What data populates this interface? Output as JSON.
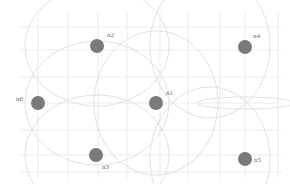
{
  "diagram": {
    "type": "wireless-network-topology",
    "width": 290,
    "height": 184,
    "colors": {
      "background": "#ffffff",
      "grid": "#e6e6e6",
      "range_circle": "#dcdcdc",
      "node": "#7a7a7a",
      "label": "#6a6a6a"
    },
    "grid": {
      "x_lines": [
        38,
        68,
        98,
        127,
        160,
        188,
        220,
        245,
        278
      ],
      "y_lines": [
        27,
        50,
        77,
        103,
        130,
        155,
        172
      ],
      "x_extent": [
        20,
        282
      ],
      "y_extent": [
        12,
        178
      ]
    },
    "nodes": [
      {
        "id": "n0",
        "label": "n0",
        "x": 38,
        "y": 103,
        "r": 7,
        "label_dx": -22,
        "label_dy": -2
      },
      {
        "id": "n1",
        "label": "n1",
        "x": 156,
        "y": 103,
        "r": 7,
        "label_dx": 10,
        "label_dy": -8
      },
      {
        "id": "n2",
        "label": "n2",
        "x": 97,
        "y": 46,
        "r": 7,
        "label_dx": 10,
        "label_dy": -9
      },
      {
        "id": "n3",
        "label": "n3",
        "x": 96,
        "y": 155,
        "r": 7,
        "label_dx": 6,
        "label_dy": 14
      },
      {
        "id": "n4",
        "label": "n4",
        "x": 245,
        "y": 47,
        "r": 7,
        "label_dx": 8,
        "label_dy": -9
      },
      {
        "id": "n5",
        "label": "n5",
        "x": 245,
        "y": 159,
        "r": 7,
        "label_dx": 9,
        "label_dy": 3
      }
    ],
    "range_circles": [
      {
        "cx": 97,
        "cy": 103,
        "rx": 72,
        "ry": 62
      },
      {
        "cx": 156,
        "cy": 103,
        "rx": 62,
        "ry": 72
      },
      {
        "cx": 97,
        "cy": 46,
        "rx": 72,
        "ry": 60
      },
      {
        "cx": 97,
        "cy": 155,
        "rx": 72,
        "ry": 60
      },
      {
        "cx": 210,
        "cy": 46,
        "rx": 60,
        "ry": 72
      },
      {
        "cx": 210,
        "cy": 159,
        "rx": 60,
        "ry": 72
      },
      {
        "cx": 245,
        "cy": 103,
        "rx": 48,
        "ry": 6
      }
    ]
  }
}
